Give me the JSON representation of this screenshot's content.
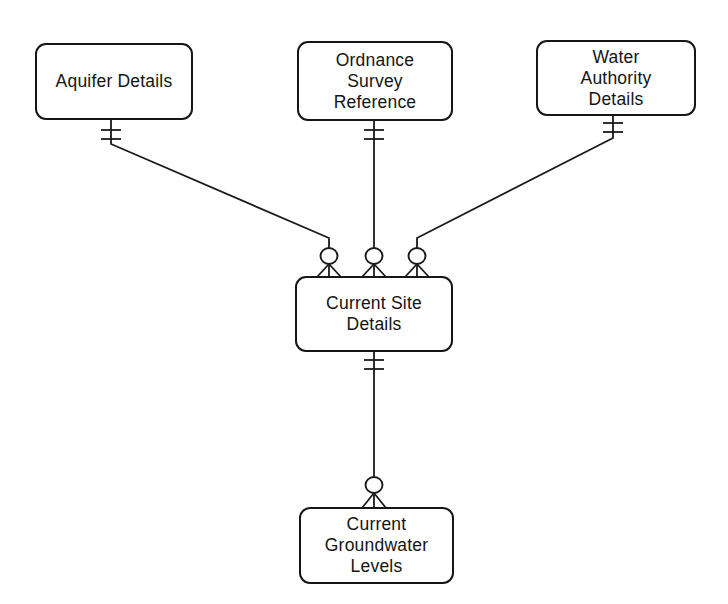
{
  "diagram": {
    "type": "entity-relationship-diagram",
    "notation": "crows-foot",
    "background_color": "#ffffff",
    "line_color": "#1a1a1a",
    "entities": {
      "aquifer": {
        "label": "Aquifer Details"
      },
      "ordnance": {
        "label": "Ordnance Survey Reference"
      },
      "water": {
        "label": "Water Authority Details"
      },
      "site": {
        "label": "Current Site Details"
      },
      "groundwater": {
        "label": "Current Groundwater Levels"
      }
    },
    "relationships": [
      {
        "from": "Aquifer Details",
        "to": "Current Site Details",
        "from_cardinality": "one-and-only-one",
        "to_cardinality": "zero-or-many"
      },
      {
        "from": "Ordnance Survey Reference",
        "to": "Current Site Details",
        "from_cardinality": "one-and-only-one",
        "to_cardinality": "zero-or-many"
      },
      {
        "from": "Water Authority Details",
        "to": "Current Site Details",
        "from_cardinality": "one-and-only-one",
        "to_cardinality": "zero-or-many"
      },
      {
        "from": "Current Site Details",
        "to": "Current Groundwater Levels",
        "from_cardinality": "one-and-only-one",
        "to_cardinality": "zero-or-many"
      }
    ]
  }
}
